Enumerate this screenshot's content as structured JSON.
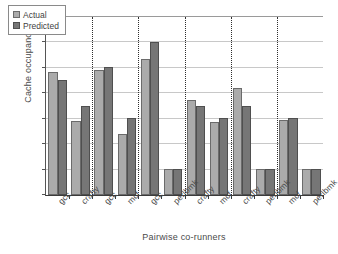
{
  "chart_data": {
    "type": "bar",
    "title": "",
    "subtitle": "",
    "xlabel": "Pairwise co-runners",
    "ylabel": "Cache occupancy (MB)",
    "ylim": [
      0,
      3.5
    ],
    "yticks": [
      "0",
      "0.5",
      "1",
      "1.5",
      "2",
      "2.5",
      "3",
      "3.5"
    ],
    "ytick_values": [
      0,
      0.5,
      1,
      1.5,
      2,
      2.5,
      3,
      3.5
    ],
    "grid": true,
    "grid_axis": "y",
    "legend": {
      "position": "upper-left",
      "entries": [
        {
          "label": "Actual",
          "color": "#ababab"
        },
        {
          "label": "Predicted",
          "color": "#767676"
        }
      ]
    },
    "categories": [
      "gcc",
      "crafty",
      "gcc",
      "mcf",
      "gcc",
      "perlbmk",
      "crafty",
      "mcf",
      "crafty",
      "perlbmk",
      "mcf",
      "perlbmk"
    ],
    "group_separators_after": [
      2,
      4,
      6,
      8,
      10
    ],
    "series": [
      {
        "name": "Actual",
        "color": "#ababab",
        "values": [
          2.41,
          1.46,
          2.46,
          1.2,
          2.67,
          0.51,
          1.87,
          1.44,
          2.1,
          0.51,
          1.47,
          0.52
        ]
      },
      {
        "name": "Predicted",
        "color": "#767676",
        "values": [
          2.26,
          1.76,
          2.51,
          1.51,
          3.0,
          0.51,
          1.76,
          1.51,
          1.76,
          0.51,
          1.52,
          0.52
        ]
      }
    ]
  }
}
